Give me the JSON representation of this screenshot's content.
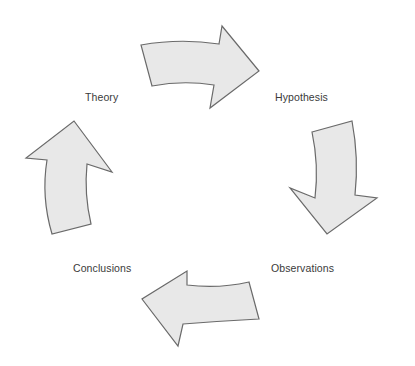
{
  "diagram": {
    "type": "cycle",
    "stages": [
      {
        "id": "theory",
        "label": "Theory"
      },
      {
        "id": "hypothesis",
        "label": "Hypothesis"
      },
      {
        "id": "observations",
        "label": "Observations"
      },
      {
        "id": "conclusions",
        "label": "Conclusions"
      }
    ],
    "arrows": [
      {
        "from": "theory",
        "to": "hypothesis",
        "direction": "right"
      },
      {
        "from": "hypothesis",
        "to": "observations",
        "direction": "down"
      },
      {
        "from": "observations",
        "to": "conclusions",
        "direction": "left"
      },
      {
        "from": "conclusions",
        "to": "theory",
        "direction": "up"
      }
    ],
    "colors": {
      "arrow_fill": "#e8e8e8",
      "arrow_stroke": "#6a6a6a",
      "label_text": "#3a3a3a",
      "background": "#ffffff"
    }
  }
}
